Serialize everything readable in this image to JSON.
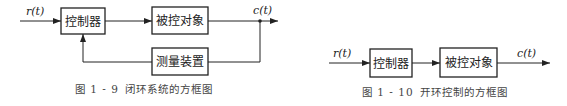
{
  "figures": [
    {
      "id": "fig-1-9",
      "caption_number": "图 1 - 9",
      "caption_title": "闭环系统的方框图",
      "input_signal": "r(t)",
      "output_signal": "c(t)",
      "blocks": [
        "控制器",
        "被控对象",
        "测量装置"
      ]
    },
    {
      "id": "fig-1-10",
      "caption_number": "图 1 - 10",
      "caption_title": "开环控制的方框图",
      "input_signal": "r(t)",
      "output_signal": "c(t)",
      "blocks": [
        "控制器",
        "被控对象"
      ]
    }
  ]
}
